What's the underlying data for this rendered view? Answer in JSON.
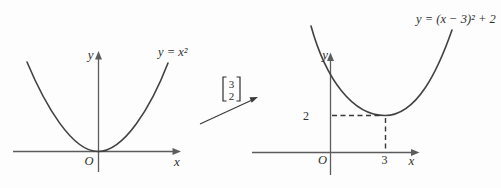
{
  "figure_type": "parabola-translation-diagram",
  "left_graph": {
    "equation_label": "y = x²",
    "y_axis_label": "y",
    "x_axis_label": "x",
    "origin_label": "O"
  },
  "translation": {
    "vector_top": "3",
    "vector_bottom": "2"
  },
  "right_graph": {
    "equation_label": "y = (x − 3)² + 2",
    "y_axis_label": "y",
    "x_axis_label": "x",
    "origin_label": "O",
    "y_tick_label": "2",
    "x_tick_label": "3"
  },
  "colors": {
    "background": "#fdfdfd",
    "axis": "#5c5c5c",
    "curve": "#424242",
    "dashed_guide": "#383838",
    "text": "#2f2f2f"
  }
}
